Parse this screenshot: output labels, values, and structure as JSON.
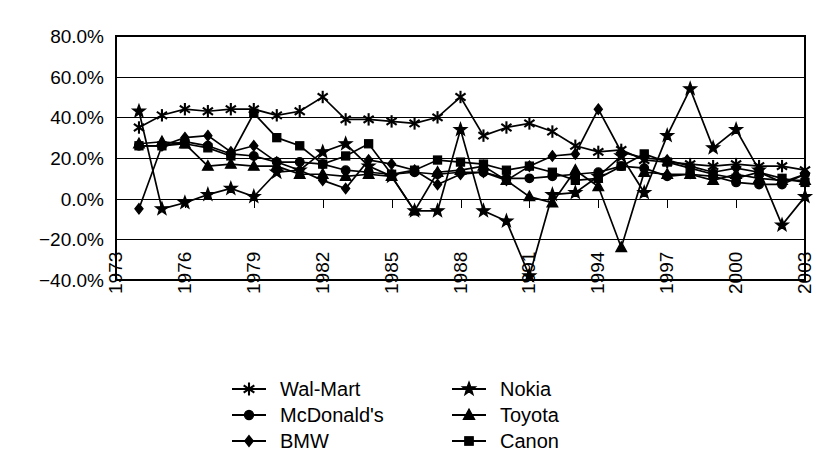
{
  "chart_data": {
    "type": "line",
    "title": "",
    "subtitle": "",
    "xlabel": "",
    "ylabel": "",
    "xlim": [
      1973,
      2003
    ],
    "ylim": [
      -40,
      80
    ],
    "ytick_labels": [
      "80.0%",
      "60.0%",
      "40.0%",
      "20.0%",
      "0.0%",
      "-20.0%",
      "-40.0%"
    ],
    "ytick_values": [
      80,
      60,
      40,
      20,
      0,
      -20,
      -40
    ],
    "xtick_labels": [
      "1973",
      "1976",
      "1979",
      "1982",
      "1985",
      "1988",
      "1991",
      "1994",
      "1997",
      "2000",
      "2003"
    ],
    "xtick_values": [
      1973,
      1976,
      1979,
      1982,
      1985,
      1988,
      1991,
      1994,
      1997,
      2000,
      2003
    ],
    "grid": "horizontal",
    "legend_position": "bottom",
    "legend_columns": 2,
    "x": [
      1973,
      1974,
      1975,
      1976,
      1977,
      1978,
      1979,
      1980,
      1981,
      1982,
      1983,
      1984,
      1985,
      1986,
      1987,
      1988,
      1989,
      1990,
      1991,
      1992,
      1993,
      1994,
      1995,
      1996,
      1997,
      1998,
      1999,
      2000,
      2001,
      2002,
      2003
    ],
    "series": [
      {
        "name": "Wal-Mart",
        "marker": "star-burst",
        "x": [
          1974,
          1975,
          1976,
          1977,
          1978,
          1979,
          1980,
          1981,
          1982,
          1983,
          1984,
          1985,
          1986,
          1987,
          1988,
          1989,
          1990,
          1991,
          1992,
          1993,
          1994,
          1995,
          1996,
          1997,
          1998,
          1999,
          2000,
          2001,
          2002,
          2003
        ],
        "values": [
          35,
          41,
          44,
          43,
          44,
          44,
          41,
          43,
          50,
          39,
          39,
          38,
          37,
          40,
          50,
          31,
          35,
          37,
          33,
          26,
          23,
          24,
          19,
          18,
          17,
          16,
          17,
          16,
          16,
          14
        ]
      },
      {
        "name": "McDonald's",
        "marker": "circle",
        "x": [
          1974,
          1975,
          1976,
          1977,
          1978,
          1979,
          1980,
          1981,
          1982,
          1983,
          1984,
          1985,
          1986,
          1987,
          1988,
          1989,
          1990,
          1991,
          1992,
          1993,
          1994,
          1995,
          1996,
          1997,
          1998,
          1999,
          2000,
          2001,
          2002,
          2003
        ],
        "values": [
          26,
          26,
          28,
          26,
          22,
          21,
          18,
          18,
          17,
          14,
          13,
          12,
          13,
          12,
          13,
          13,
          10,
          10,
          11,
          12,
          13,
          16,
          15,
          11,
          12,
          11,
          8,
          7,
          7,
          12
        ]
      },
      {
        "name": "BMW",
        "marker": "diamond",
        "x": [
          1974,
          1975,
          1976,
          1977,
          1978,
          1979,
          1980,
          1981,
          1982,
          1983,
          1984,
          1985,
          1986,
          1987,
          1988,
          1989,
          1990,
          1991,
          1992,
          1993,
          1994,
          1995,
          1996,
          1997,
          1998,
          1999,
          2000,
          2001,
          2002,
          2003
        ],
        "values": [
          -5,
          26,
          30,
          31,
          23,
          26,
          18,
          14,
          9,
          5,
          19,
          17,
          14,
          7,
          12,
          13,
          9,
          16,
          21,
          22,
          44,
          23,
          20,
          19,
          16,
          13,
          15,
          13,
          8,
          12
        ]
      },
      {
        "name": "Nokia",
        "marker": "star",
        "x": [
          1974,
          1975,
          1976,
          1977,
          1978,
          1979,
          1980,
          1981,
          1982,
          1983,
          1984,
          1985,
          1986,
          1987,
          1988,
          1989,
          1990,
          1991,
          1992,
          1993,
          1994,
          1995,
          1996,
          1997,
          1998,
          1999,
          2000,
          2001,
          2002,
          2003
        ],
        "values": [
          43,
          -5,
          -2,
          2,
          5,
          1,
          13,
          14,
          23,
          27,
          16,
          11,
          -6,
          -6,
          34,
          -6,
          -11,
          -38,
          2,
          3,
          11,
          21,
          3,
          31,
          54,
          25,
          34,
          14,
          -13,
          1
        ]
      },
      {
        "name": "Toyota",
        "marker": "triangle",
        "x": [
          1974,
          1975,
          1976,
          1977,
          1978,
          1979,
          1980,
          1981,
          1982,
          1983,
          1984,
          1985,
          1986,
          1987,
          1988,
          1989,
          1990,
          1991,
          1992,
          1993,
          1994,
          1995,
          1996,
          1997,
          1998,
          1999,
          2000,
          2001,
          2002,
          2003
        ],
        "values": [
          27,
          28,
          27,
          16,
          17,
          16,
          16,
          12,
          12,
          11,
          12,
          11,
          -6,
          13,
          14,
          16,
          9,
          1,
          -2,
          14,
          6,
          -24,
          13,
          12,
          12,
          9,
          12,
          10,
          9,
          9
        ]
      },
      {
        "name": "Canon",
        "marker": "square",
        "x": [
          1974,
          1975,
          1976,
          1977,
          1978,
          1979,
          1980,
          1981,
          1982,
          1983,
          1984,
          1985,
          1986,
          1987,
          1988,
          1989,
          1990,
          1991,
          1992,
          1993,
          1994,
          1995,
          1996,
          1997,
          1998,
          1999,
          2000,
          2001,
          2002,
          2003
        ],
        "values": [
          26,
          26,
          27,
          25,
          21,
          42,
          30,
          26,
          17,
          21,
          27,
          12,
          14,
          19,
          18,
          17,
          14,
          16,
          13,
          9,
          10,
          16,
          22,
          18,
          15,
          12,
          10,
          13,
          10,
          8
        ]
      }
    ]
  },
  "legend": {
    "entries": [
      {
        "label": "Wal-Mart",
        "marker": "star-burst"
      },
      {
        "label": "Nokia",
        "marker": "star"
      },
      {
        "label": "McDonald's",
        "marker": "circle"
      },
      {
        "label": "Toyota",
        "marker": "triangle"
      },
      {
        "label": "BMW",
        "marker": "diamond"
      },
      {
        "label": "Canon",
        "marker": "square"
      }
    ]
  },
  "style": {
    "line_color": "#000000",
    "background": "#ffffff",
    "grid_color": "#000000"
  }
}
